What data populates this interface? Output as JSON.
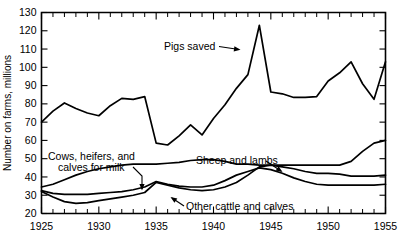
{
  "chart_data": {
    "type": "line",
    "title": "",
    "xlabel": "",
    "ylabel": "Number on farms, millions",
    "xlim": [
      1925,
      1955
    ],
    "ylim": [
      20,
      130
    ],
    "grid": false,
    "legend_position": "inline-annotations",
    "y_ticks": [
      20,
      30,
      40,
      50,
      60,
      70,
      80,
      90,
      100,
      110,
      120,
      130
    ],
    "y_tick_labels": [
      "20",
      "30",
      "40",
      "50",
      "60",
      "70",
      "80",
      "90",
      "100",
      "110",
      "120",
      "130"
    ],
    "x_ticks": [
      1925,
      1926,
      1927,
      1928,
      1929,
      1930,
      1931,
      1932,
      1933,
      1934,
      1935,
      1936,
      1937,
      1938,
      1939,
      1940,
      1941,
      1942,
      1943,
      1944,
      1945,
      1946,
      1947,
      1948,
      1949,
      1950,
      1951,
      1952,
      1953,
      1954,
      1955
    ],
    "x_tick_labels_major": [
      "1925",
      "1930",
      "1935",
      "1940",
      "1945",
      "1950",
      "1955"
    ],
    "x_major_ticks": [
      1925,
      1930,
      1935,
      1940,
      1945,
      1950,
      1955
    ],
    "x": [
      1925,
      1926,
      1927,
      1928,
      1929,
      1930,
      1931,
      1932,
      1933,
      1934,
      1935,
      1936,
      1937,
      1938,
      1939,
      1940,
      1941,
      1942,
      1943,
      1944,
      1945,
      1946,
      1947,
      1948,
      1949,
      1950,
      1951,
      1952,
      1953,
      1954,
      1955
    ],
    "series": [
      {
        "name": "Pigs saved",
        "label": "Pigs saved",
        "values": [
          70.0,
          76.0,
          80.5,
          77.5,
          75.0,
          73.5,
          79.0,
          83.0,
          82.5,
          84.0,
          58.5,
          57.5,
          62.5,
          68.5,
          63.0,
          72.0,
          79.5,
          88.5,
          96.0,
          123.0,
          86.5,
          85.5,
          83.5,
          83.5,
          84.0,
          92.5,
          97.0,
          103.0,
          91.0,
          82.5,
          103.0
        ]
      },
      {
        "name": "Sheep and lambs",
        "label": "Sheep and lambs",
        "values": [
          34.5,
          36.0,
          38.5,
          41.0,
          43.0,
          44.5,
          45.5,
          46.5,
          47.0,
          47.0,
          47.0,
          47.5,
          48.0,
          49.0,
          49.5,
          49.5,
          48.5,
          47.0,
          47.0,
          46.5,
          46.5,
          46.5,
          46.5,
          46.5,
          46.5,
          46.5,
          46.5,
          48.5,
          54.0,
          58.5,
          60.0
        ]
      },
      {
        "name": "Cows, heifers, and calves for milk",
        "label": "Cows, heifers, and calves for milk",
        "values": [
          32.5,
          31.0,
          30.5,
          30.5,
          30.5,
          31.0,
          31.5,
          32.0,
          33.0,
          34.5,
          37.5,
          36.0,
          35.0,
          34.5,
          34.5,
          35.5,
          38.0,
          41.0,
          43.0,
          45.0,
          44.0,
          42.0,
          39.5,
          37.5,
          36.0,
          35.5,
          35.5,
          35.5,
          35.5,
          35.5,
          36.0
        ]
      },
      {
        "name": "Other cattle and calves",
        "label": "Other cattle and calves",
        "values": [
          32.0,
          29.0,
          26.5,
          25.5,
          26.0,
          27.0,
          28.0,
          29.0,
          30.0,
          31.5,
          37.0,
          35.5,
          34.0,
          33.0,
          32.5,
          33.0,
          34.5,
          37.0,
          41.0,
          45.5,
          46.5,
          45.5,
          44.5,
          43.0,
          42.0,
          42.0,
          41.5,
          40.5,
          40.5,
          40.5,
          41.0
        ]
      }
    ],
    "annotations": [
      {
        "text": "Pigs saved",
        "x": 1938.0,
        "y": 110.0
      },
      {
        "text": "Sheep and lambs",
        "x": 1936.2,
        "y": 56.0
      },
      {
        "text": "Cows, heifers, and",
        "x": 1926.2,
        "y": 59.0
      },
      {
        "text": "calves for milk",
        "x": 1927.2,
        "y": 54.5
      },
      {
        "text": "Other cattle and calves",
        "x": 1938.0,
        "y": 25.5
      }
    ],
    "colors": {
      "line": "#000000",
      "background": "#ffffff",
      "axis": "#000000"
    }
  }
}
